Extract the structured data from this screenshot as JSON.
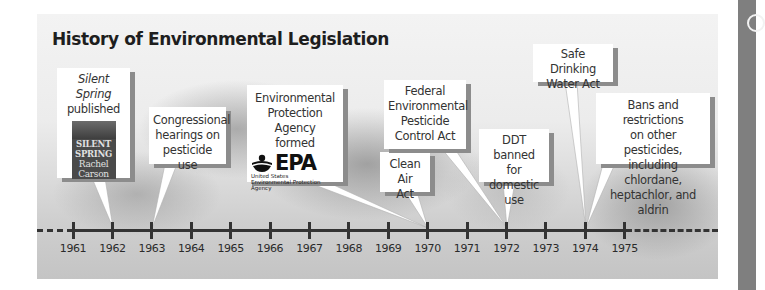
{
  "title": "History of Environmental Legislation",
  "timeline": {
    "years": [
      "1961",
      "1962",
      "1963",
      "1964",
      "1965",
      "1966",
      "1967",
      "1968",
      "1969",
      "1970",
      "1971",
      "1972",
      "1973",
      "1974",
      "1975"
    ],
    "line_color": "#333333"
  },
  "events": [
    {
      "id": "silent-spring",
      "year": "1962",
      "title_italic": "Silent Spring",
      "text": "published",
      "image": {
        "type": "book-cover",
        "lines": [
          "SILENT",
          "SPRING",
          "Rachel",
          "Carson"
        ]
      }
    },
    {
      "id": "congressional-hearings",
      "year": "1963",
      "text_lines": [
        "Congressional",
        "hearings on",
        "pesticide use"
      ]
    },
    {
      "id": "epa-formed",
      "year": "1970",
      "text_lines": [
        "Environmental",
        "Protection Agency",
        "formed"
      ],
      "logo": {
        "word": "EPA",
        "sub_lines": [
          "United States",
          "Environmental Protection",
          "Agency"
        ]
      }
    },
    {
      "id": "clean-air-act",
      "year": "1970",
      "text_lines": [
        "Clean Air",
        "Act"
      ]
    },
    {
      "id": "fepca",
      "year": "1972",
      "text_lines": [
        "Federal",
        "Environmental",
        "Pesticide",
        "Control Act"
      ]
    },
    {
      "id": "ddt-banned",
      "year": "1972",
      "text_lines": [
        "DDT banned",
        "for domestic",
        "use"
      ]
    },
    {
      "id": "safe-drinking-water",
      "year": "1974",
      "text_lines": [
        "Safe Drinking",
        "Water Act"
      ]
    },
    {
      "id": "bans-restrictions",
      "year": "1974",
      "text_lines": [
        "Bans and restrictions",
        "on other pesticides,",
        "including chlordane,",
        "heptachlor, and aldrin"
      ]
    }
  ]
}
